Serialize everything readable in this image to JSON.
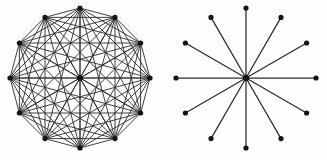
{
  "figure": {
    "background_color": "#fdfdfd",
    "edge_color": "#2b2b2b",
    "node_color": "#141414",
    "width": 327,
    "height": 160,
    "panels": [
      {
        "id": "complete-graph-panel",
        "name": "complete-graph-k13",
        "description": "Complete graph on 13 vertices: 12 vertices evenly spaced on a circle plus one central hub, every pair joined by a straight chord",
        "center": {
          "x": 80,
          "y": 78
        },
        "radius": 70,
        "rim_vertex_count": 12,
        "hub_vertex_count": 1,
        "total_vertex_count": 13,
        "edge_count": 78,
        "angle_step_degrees": 30,
        "start_angle_degrees": -90,
        "node_radius": 2.6,
        "hub_radius": 3.0,
        "edge_width": 0.9,
        "draw_all_chords": true,
        "draw_hub_spokes": true
      },
      {
        "id": "star-graph-panel",
        "name": "star-graph-k1-12",
        "description": "Star graph K(1,12): one central hub joined by a single straight spoke to each of 12 vertices evenly spaced on a circle; no rim chords",
        "center": {
          "x": 246,
          "y": 78
        },
        "radius": 70,
        "rim_vertex_count": 12,
        "hub_vertex_count": 1,
        "total_vertex_count": 13,
        "edge_count": 12,
        "angle_step_degrees": 30,
        "start_angle_degrees": -90,
        "node_radius": 2.6,
        "hub_radius": 3.2,
        "edge_width": 1.25,
        "draw_all_chords": false,
        "draw_hub_spokes": true
      }
    ]
  },
  "chart_data": {
    "type": "diagram",
    "title": "",
    "subtitle": "",
    "graphs": [
      {
        "label": "complete graph",
        "notation": "K13",
        "vertices": 13,
        "edges": 78,
        "layout": "circular with center",
        "rim_vertices": 12,
        "degree_rim": 12,
        "degree_center": 12
      },
      {
        "label": "star graph",
        "notation": "K1,12",
        "vertices": 13,
        "edges": 12,
        "layout": "circular with center",
        "rim_vertices": 12,
        "degree_rim": 1,
        "degree_center": 12
      }
    ]
  }
}
